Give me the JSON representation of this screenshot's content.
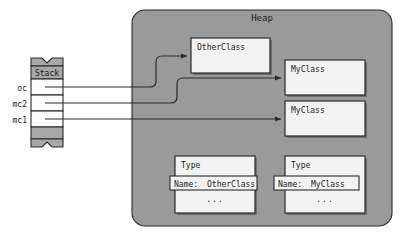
{
  "diagram": {
    "colors": {
      "heap_fill": "#9a9a9a",
      "stack_fill": "#a8a8a8",
      "box_fill": "#f2f2f2",
      "stroke": "#2b2b2b",
      "shadow": "#6e6e6e",
      "text": "#1a1a1a",
      "page_bg": "#ffffff"
    },
    "stack": {
      "label": "Stack",
      "slots": [
        {
          "name": "oc",
          "label": "oc"
        },
        {
          "name": "mc2",
          "label": "mc2"
        },
        {
          "name": "mc1",
          "label": "mc1"
        }
      ]
    },
    "heap": {
      "label": "Heap",
      "objects": [
        {
          "name": "otherclass-instance",
          "label": "OtherClass"
        },
        {
          "name": "myclass-instance-1",
          "label": "MyClass"
        },
        {
          "name": "myclass-instance-2",
          "label": "MyClass"
        }
      ],
      "type_objects": [
        {
          "name": "type-otherclass",
          "label": "Type",
          "field_key": "Name:",
          "field_value": "OtherClass",
          "more": "..."
        },
        {
          "name": "type-myclass",
          "label": "Type",
          "field_key": "Name:",
          "field_value": "MyClass",
          "more": "..."
        }
      ]
    },
    "arrows": [
      {
        "name": "arrow-oc-to-otherclass",
        "from": "oc",
        "to": "otherclass-instance"
      },
      {
        "name": "arrow-mc2-to-myclass-1",
        "from": "mc2",
        "to": "myclass-instance-1"
      },
      {
        "name": "arrow-mc1-to-myclass-2",
        "from": "mc1",
        "to": "myclass-instance-2"
      }
    ]
  }
}
